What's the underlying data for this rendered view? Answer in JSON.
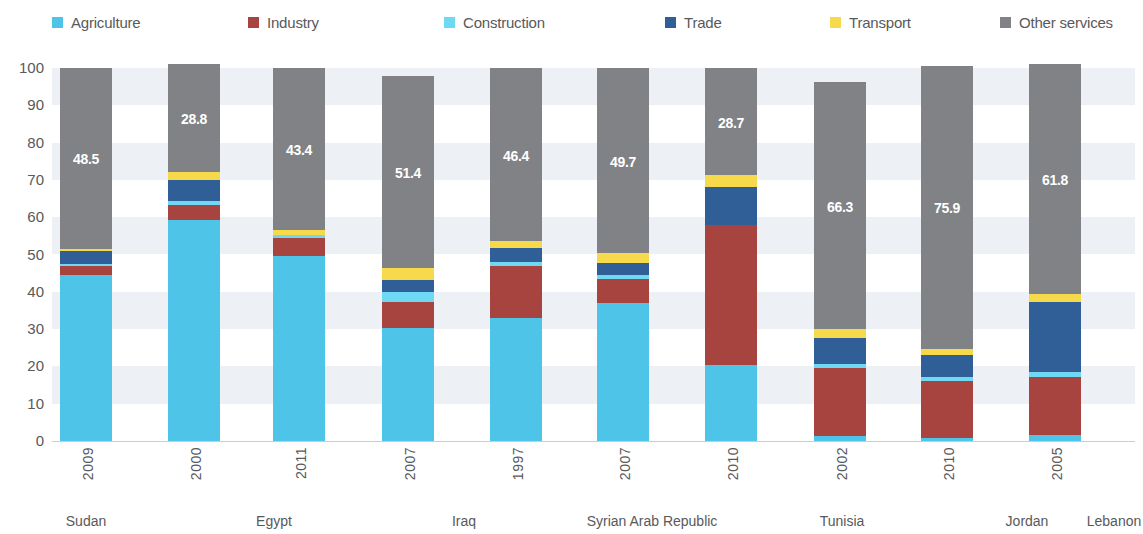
{
  "legend": {
    "items": [
      {
        "label": "Agriculture",
        "color": "#4dc4e8",
        "swatch": "legend-swatch-agriculture",
        "x": 52
      },
      {
        "label": "Industry",
        "color": "#a8443f",
        "swatch": "legend-swatch-industry",
        "x": 248
      },
      {
        "label": "Construction",
        "color": "#6fd8f2",
        "swatch": "legend-swatch-construction",
        "x": 444
      },
      {
        "label": "Trade",
        "color": "#2f5f96",
        "swatch": "legend-swatch-trade",
        "x": 665
      },
      {
        "label": "Transport",
        "color": "#f7d94c",
        "swatch": "legend-swatch-transport",
        "x": 830
      },
      {
        "label": "Other services",
        "color": "#808285",
        "swatch": "legend-swatch-other",
        "x": 1000
      }
    ]
  },
  "axis": {
    "ticks": [
      "100",
      "90",
      "80",
      "70",
      "60",
      "50",
      "40",
      "30",
      "20",
      "10",
      "0"
    ]
  },
  "chart_data": {
    "type": "bar",
    "stacked": true,
    "title": "",
    "xlabel": "",
    "ylabel": "",
    "ylim": [
      0,
      100
    ],
    "grid": "horizontal-bands",
    "legend_position": "top",
    "categories": [
      {
        "country": "Sudan",
        "year": "2009"
      },
      {
        "country": "Egypt",
        "year": "2000"
      },
      {
        "country": "Egypt",
        "year": "2011"
      },
      {
        "country": "Iraq",
        "year": "2007"
      },
      {
        "country": "Syrian Arab Republic",
        "year": "1997"
      },
      {
        "country": "Syrian Arab Republic",
        "year": "2007"
      },
      {
        "country": "Tunisia",
        "year": "2010"
      },
      {
        "country": "Jordan",
        "year": "2002"
      },
      {
        "country": "Jordan",
        "year": "2010"
      },
      {
        "country": "Lebanon",
        "year": "2005"
      }
    ],
    "country_groups": [
      {
        "label": "Sudan",
        "center": 78
      },
      {
        "label": "Egypt",
        "center": 265
      },
      {
        "label": "Iraq",
        "center": 455
      },
      {
        "label": "Syrian Arab Republic",
        "center": 640
      },
      {
        "label": "Tunisia",
        "center": 830
      },
      {
        "label": "Jordan",
        "center": 1015
      },
      {
        "label": "Lebanon",
        "center": 1150
      }
    ],
    "series": [
      {
        "name": "Agriculture",
        "color": "#4dc4e8",
        "values": [
          44.6,
          59.3,
          49.7,
          30.4,
          33.0,
          37.0,
          20.4,
          1.3,
          0.8,
          1.6
        ]
      },
      {
        "name": "Industry",
        "color": "#a8443f",
        "values": [
          2.4,
          4.0,
          4.8,
          6.9,
          13.9,
          6.5,
          37.6,
          18.3,
          15.3,
          15.6
        ]
      },
      {
        "name": "Construction",
        "color": "#6fd8f2",
        "values": [
          0.5,
          1.1,
          0.8,
          2.7,
          1.1,
          1.1,
          0.0,
          1.1,
          1.1,
          1.3
        ]
      },
      {
        "name": "Trade",
        "color": "#2f5f96",
        "values": [
          3.5,
          5.6,
          0.0,
          3.2,
          3.8,
          3.2,
          10.2,
          7.0,
          5.9,
          18.8
        ]
      },
      {
        "name": "Transport",
        "color": "#f7d94c",
        "values": [
          0.6,
          2.2,
          1.3,
          3.2,
          1.8,
          2.5,
          3.1,
          2.2,
          1.6,
          2.1
        ]
      },
      {
        "name": "Other services",
        "color": "#808285",
        "values": [
          48.5,
          28.8,
          43.4,
          51.4,
          46.4,
          49.7,
          28.7,
          66.3,
          75.9,
          61.8
        ]
      }
    ],
    "bar_labels": [
      "48.5",
      "28.8",
      "43.4",
      "51.4",
      "46.4",
      "49.7",
      "28.7",
      "66.3",
      "75.9",
      "61.8"
    ],
    "bar_label_series": "Other services"
  }
}
